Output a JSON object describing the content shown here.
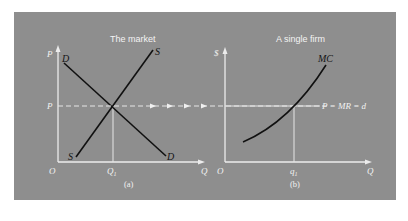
{
  "figure": {
    "background_color": "#8e8e8e",
    "curve_color": "#111111",
    "axis_color": "#ececec"
  },
  "panel_a": {
    "title": "The market",
    "caption": "(a)",
    "y_axis_label": "P",
    "x_axis_label": "Q",
    "origin_label": "O",
    "price_label": "P",
    "quantity_label": "Q",
    "quantity_subscript": "1",
    "demand_label_top": "D",
    "demand_label_bottom": "D",
    "supply_label_top": "S",
    "supply_label_bottom": "S"
  },
  "panel_b": {
    "title": "A single firm",
    "caption": "(b)",
    "y_axis_label": "$",
    "x_axis_label": "Q",
    "origin_label": "O",
    "quantity_label": "q",
    "quantity_subscript": "1",
    "mc_label": "MC",
    "price_line_label": "P = MR = d"
  }
}
